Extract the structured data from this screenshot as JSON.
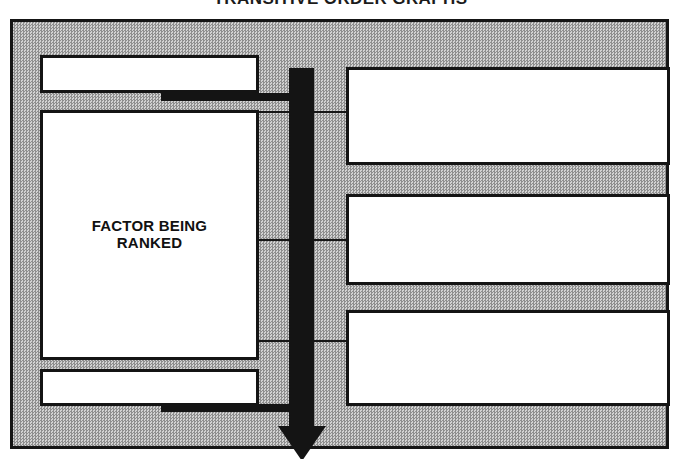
{
  "title": "TRANSITIVE ORDER GRAPHS",
  "diagram": {
    "left_column": {
      "top_box": {
        "label": ""
      },
      "main_box": {
        "label": "FACTOR BEING\nRANKED"
      },
      "bottom_box": {
        "label": ""
      }
    },
    "right_column": {
      "boxes": [
        {
          "label": ""
        },
        {
          "label": ""
        },
        {
          "label": ""
        }
      ]
    },
    "arrow": {
      "direction": "down",
      "label": ""
    },
    "colors": {
      "panel_background": "#b4b4b4",
      "panel_border": "#151515",
      "box_fill": "#ffffff",
      "box_border": "#141414",
      "connector": "#141414",
      "text": "#111111"
    }
  }
}
